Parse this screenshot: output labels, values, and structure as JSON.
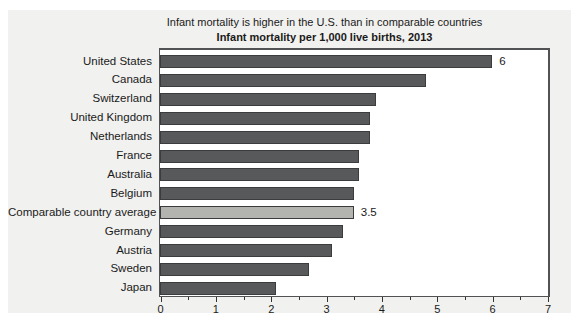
{
  "header": {
    "title": "Infant mortality is higher in the U.S. than in comparable countries",
    "subtitle": "Infant mortality per 1,000 live births, 2013"
  },
  "chart_data": {
    "type": "bar",
    "orientation": "horizontal",
    "title": "Infant mortality is higher in the U.S. than in comparable countries",
    "subtitle": "Infant mortality per 1,000 live births, 2013",
    "xlabel": "",
    "ylabel": "",
    "categories": [
      "United States",
      "Canada",
      "Switzerland",
      "United Kingdom",
      "Netherlands",
      "France",
      "Australia",
      "Belgium",
      "Comparable country average",
      "Germany",
      "Austria",
      "Sweden",
      "Japan"
    ],
    "values": [
      6.0,
      4.8,
      3.9,
      3.8,
      3.8,
      3.6,
      3.6,
      3.5,
      3.5,
      3.3,
      3.1,
      2.7,
      2.1
    ],
    "value_labels": [
      "6",
      "",
      "",
      "",
      "",
      "",
      "",
      "",
      "3.5",
      "",
      "",
      "",
      ""
    ],
    "highlight_index": 8,
    "xlim": [
      0,
      7
    ],
    "x_major_ticks": [
      0,
      1,
      2,
      3,
      4,
      5,
      6,
      7
    ],
    "x_minor_tick_step": 0.5,
    "grid": false,
    "legend": "none",
    "colors": {
      "bar_fill": "#58595b",
      "bar_border": "#3b3c3e",
      "highlight_fill": "#b3b3b0",
      "highlight_border": "#3b3c3e",
      "panel_bg": "#f1f1ef",
      "plot_bg": "#ffffff",
      "frame": "#515254",
      "tick": "#333333",
      "text": "#1a1a1a"
    }
  }
}
